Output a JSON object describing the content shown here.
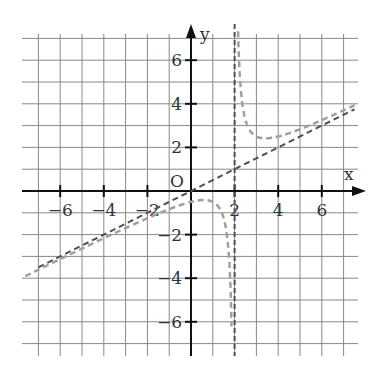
{
  "chart_data": {
    "type": "line",
    "title": "",
    "xlabel": "x",
    "ylabel": "y",
    "origin_label": "O",
    "xlim": [
      -7.0,
      7.5
    ],
    "ylim": [
      -7.5,
      7.3
    ],
    "grid": true,
    "grid_step": 1,
    "x_ticks": [
      -6,
      -4,
      -2,
      2,
      4,
      6
    ],
    "x_tick_labels": [
      "−6",
      "−4",
      "−2",
      "2",
      "4",
      "6"
    ],
    "y_ticks": [
      6,
      4,
      2,
      -2,
      -4,
      -6
    ],
    "y_tick_labels": [
      "6",
      "4",
      "2",
      "−2",
      "−4",
      "−6"
    ],
    "series": [
      {
        "name": "f(x) = x/2 + 1/(x − 2)",
        "style": "dashed",
        "color": "#a0a0a0",
        "points_sample": [
          [
            -7,
            -3.61
          ],
          [
            -4,
            -2.17
          ],
          [
            -2,
            -1.25
          ],
          [
            0,
            -0.5
          ],
          [
            1,
            -0.5
          ],
          [
            1.5,
            -1.25
          ],
          [
            1.8,
            -4.1
          ],
          [
            2.2,
            6.1
          ],
          [
            2.5,
            3.25
          ],
          [
            3,
            2.5
          ],
          [
            4,
            2.5
          ],
          [
            6,
            3.25
          ],
          [
            7.5,
            3.93
          ]
        ]
      },
      {
        "name": "oblique asymptote y = x/2",
        "style": "dashed",
        "color": "#505050",
        "points_sample": [
          [
            -7,
            -3.5
          ],
          [
            0,
            0
          ],
          [
            2,
            1
          ],
          [
            6,
            3
          ],
          [
            7.5,
            3.75
          ]
        ]
      },
      {
        "name": "vertical asymptote x = 2",
        "style": "dashed",
        "color": "#505050",
        "points_sample": [
          [
            2,
            -7.5
          ],
          [
            2,
            7.5
          ]
        ]
      }
    ]
  }
}
